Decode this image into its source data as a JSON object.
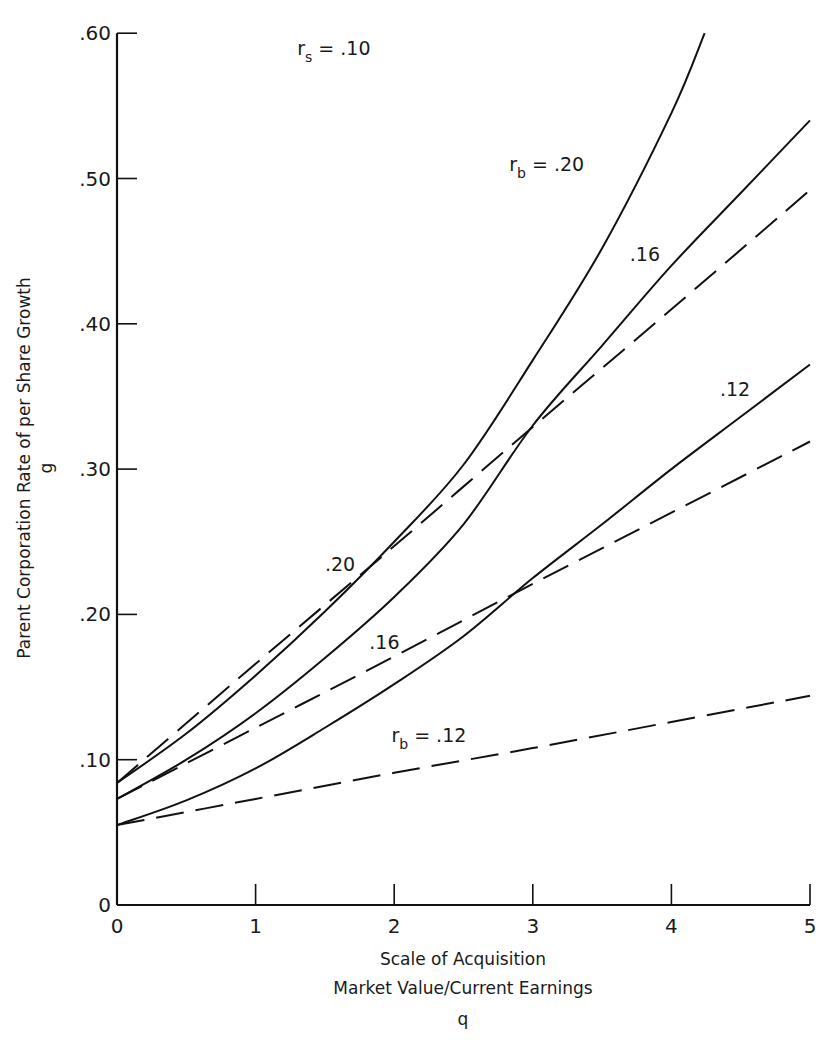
{
  "chart_data": {
    "type": "line",
    "title": "",
    "xlabel": "Scale of Acquisition",
    "xlabel_line2": "Market Value/Current Earnings",
    "xlabel_symbol": "q",
    "ylabel": "Parent Corporation Rate of per Share Growth",
    "ylabel_symbol": "g",
    "xlim": [
      0,
      5
    ],
    "ylim": [
      0,
      0.6
    ],
    "x_ticks": [
      0,
      1,
      2,
      3,
      4,
      5
    ],
    "x_tick_labels": [
      "0",
      "1",
      "2",
      "3",
      "4",
      "5"
    ],
    "y_ticks": [
      0,
      0.1,
      0.2,
      0.3,
      0.4,
      0.5,
      0.6
    ],
    "y_tick_labels": [
      "0",
      ".10",
      ".20",
      ".30",
      ".40",
      ".50",
      ".60"
    ],
    "grid": false,
    "legend": "none (curves labeled inline)",
    "annotations": [
      {
        "text": "r",
        "sub": "s",
        "rest": " = .10",
        "x": 1.3,
        "y": 0.585
      },
      {
        "text": "r",
        "sub": "b",
        "rest": " = .20",
        "x": 2.83,
        "y": 0.505
      },
      {
        "text": ".16",
        "rest": "",
        "x": 3.7,
        "y": 0.443
      },
      {
        "text": ".12",
        "rest": "",
        "x": 4.35,
        "y": 0.35
      },
      {
        "text": ".20",
        "rest": "",
        "x": 1.5,
        "y": 0.23
      },
      {
        "text": ".16",
        "rest": "",
        "x": 1.82,
        "y": 0.176
      },
      {
        "text": "r",
        "sub": "b",
        "rest": " = .12",
        "x": 1.98,
        "y": 0.112
      }
    ],
    "series": [
      {
        "name": "r_b = .20 (solid)",
        "style": "solid",
        "x": [
          0,
          0.5,
          1,
          1.5,
          2,
          2.5,
          3,
          3.5,
          4,
          4.24
        ],
        "y": [
          0.084,
          0.118,
          0.158,
          0.202,
          0.25,
          0.303,
          0.375,
          0.452,
          0.545,
          0.6
        ]
      },
      {
        "name": "r_b = .16 (solid)",
        "style": "solid",
        "x": [
          0,
          0.5,
          1,
          1.5,
          2,
          2.5,
          3,
          3.5,
          4,
          4.5,
          5
        ],
        "y": [
          0.073,
          0.1,
          0.132,
          0.17,
          0.212,
          0.262,
          0.33,
          0.385,
          0.44,
          0.49,
          0.54
        ]
      },
      {
        "name": "r_b = .12 (solid)",
        "style": "solid",
        "x": [
          0,
          0.5,
          1,
          1.5,
          2,
          2.5,
          3,
          3.5,
          4,
          4.5,
          5
        ],
        "y": [
          0.055,
          0.072,
          0.094,
          0.122,
          0.152,
          0.185,
          0.225,
          0.262,
          0.3,
          0.336,
          0.372
        ]
      },
      {
        "name": "r_b = .20 (dashed)",
        "style": "dashed",
        "x": [
          0,
          1,
          2,
          3,
          4,
          5
        ],
        "y": [
          0.084,
          0.166,
          0.247,
          0.329,
          0.41,
          0.492
        ]
      },
      {
        "name": "r_b = .16 (dashed)",
        "style": "dashed",
        "x": [
          0,
          1,
          2,
          3,
          4,
          5
        ],
        "y": [
          0.073,
          0.122,
          0.171,
          0.221,
          0.27,
          0.319
        ]
      },
      {
        "name": "r_b = .12 (dashed)",
        "style": "dashed",
        "x": [
          0,
          1,
          2,
          3,
          4,
          5
        ],
        "y": [
          0.055,
          0.073,
          0.091,
          0.108,
          0.126,
          0.144
        ]
      }
    ]
  },
  "plot": {
    "x0_px": 117,
    "x_px_per_unit": 138.6,
    "y0_px": 905,
    "y_px_per_unit": 1453,
    "axis_color": "#111111",
    "line_color": "#111111"
  }
}
